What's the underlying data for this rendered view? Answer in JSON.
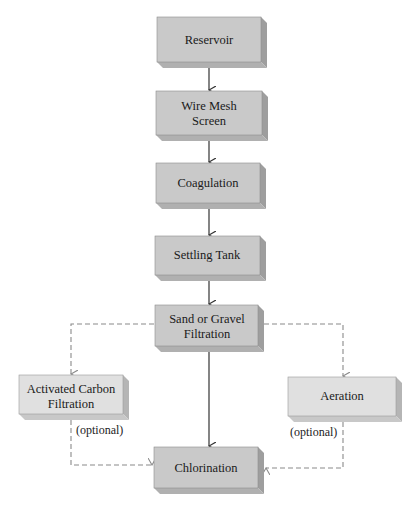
{
  "diagram": {
    "type": "flowchart",
    "colors": {
      "main_front": "#c9c9c9",
      "main_side": "#9e9e9e",
      "main_bottom": "#b0b0b0",
      "optional_front": "#e0e0e0",
      "optional_side": "#b5b5b5",
      "optional_bottom": "#c8c8c8",
      "solid_arrow": "#333333",
      "dashed_arrow": "#8a8a8a"
    },
    "nodes": [
      {
        "id": "reservoir",
        "lines": [
          "Reservoir"
        ],
        "optional": false
      },
      {
        "id": "wire-mesh-screen",
        "lines": [
          "Wire Mesh",
          "Screen"
        ],
        "optional": false
      },
      {
        "id": "coagulation",
        "lines": [
          "Coagulation"
        ],
        "optional": false
      },
      {
        "id": "settling-tank",
        "lines": [
          "Settling Tank"
        ],
        "optional": false
      },
      {
        "id": "sand-gravel-filtration",
        "lines": [
          "Sand or Gravel",
          "Filtration"
        ],
        "optional": false
      },
      {
        "id": "activated-carbon-filtration",
        "lines": [
          "Activated Carbon",
          "Filtration"
        ],
        "optional": true
      },
      {
        "id": "aeration",
        "lines": [
          "Aeration"
        ],
        "optional": true
      },
      {
        "id": "chlorination",
        "lines": [
          "Chlorination"
        ],
        "optional": false
      }
    ],
    "edges": [
      {
        "from": "reservoir",
        "to": "wire-mesh-screen",
        "style": "solid"
      },
      {
        "from": "wire-mesh-screen",
        "to": "coagulation",
        "style": "solid"
      },
      {
        "from": "coagulation",
        "to": "settling-tank",
        "style": "solid"
      },
      {
        "from": "settling-tank",
        "to": "sand-gravel-filtration",
        "style": "solid"
      },
      {
        "from": "sand-gravel-filtration",
        "to": "chlorination",
        "style": "solid"
      },
      {
        "from": "sand-gravel-filtration",
        "to": "activated-carbon-filtration",
        "style": "dashed"
      },
      {
        "from": "sand-gravel-filtration",
        "to": "aeration",
        "style": "dashed"
      },
      {
        "from": "activated-carbon-filtration",
        "to": "chlorination",
        "style": "dashed",
        "label": "(optional)"
      },
      {
        "from": "aeration",
        "to": "chlorination",
        "style": "dashed",
        "label": "(optional)"
      }
    ],
    "labels": {
      "optional_left": "(optional)",
      "optional_right": "(optional)"
    }
  }
}
